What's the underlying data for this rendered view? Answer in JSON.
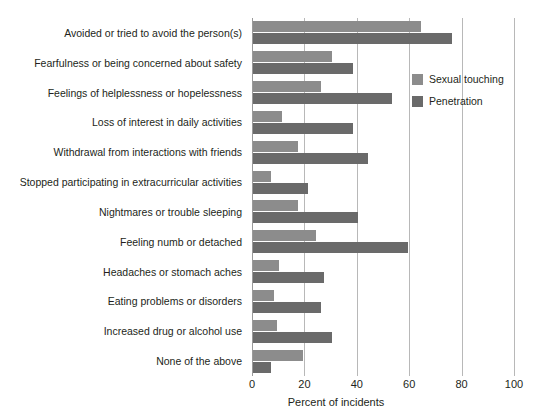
{
  "chart_data": {
    "type": "bar",
    "orientation": "horizontal",
    "grouped": true,
    "title": "",
    "xlabel": "Percent of incidents",
    "ylabel": "",
    "xlim": [
      0,
      100
    ],
    "xticks": [
      0,
      20,
      40,
      60,
      80,
      100
    ],
    "grid": "vertical",
    "legend_position": "upper-right-inside",
    "categories": [
      "Avoided or tried to avoid the person(s)",
      "Fearfulness or being concerned about safety",
      "Feelings of helplessness or hopelessness",
      "Loss of interest in daily activities",
      "Withdrawal from interactions with friends",
      "Stopped participating in extracurricular activities",
      "Nightmares or trouble sleeping",
      "Feeling numb or detached",
      "Headaches or stomach aches",
      "Eating problems or disorders",
      "Increased drug or alcohol use",
      "None of the above"
    ],
    "series": [
      {
        "name": "Sexual touching",
        "color": "#8c8c8c",
        "values": [
          64,
          30,
          26,
          11,
          17,
          7,
          17,
          24,
          10,
          8,
          9,
          19
        ]
      },
      {
        "name": "Penetration",
        "color": "#6a6a6a",
        "values": [
          76,
          38,
          53,
          38,
          44,
          21,
          40,
          59,
          27,
          26,
          30,
          7
        ]
      }
    ]
  },
  "axis": {
    "tick_labels": [
      "0",
      "20",
      "40",
      "60",
      "80",
      "100"
    ],
    "x_title": "Percent of incidents"
  },
  "legend": {
    "items": [
      {
        "label": "Sexual touching",
        "color": "#8c8c8c"
      },
      {
        "label": "Penetration",
        "color": "#6a6a6a"
      }
    ]
  },
  "colors": {
    "light_gray": "#8c8c8c",
    "dark_gray": "#6a6a6a",
    "gridline": "#b8b8b8",
    "text": "#231f20",
    "background": "#ffffff"
  }
}
